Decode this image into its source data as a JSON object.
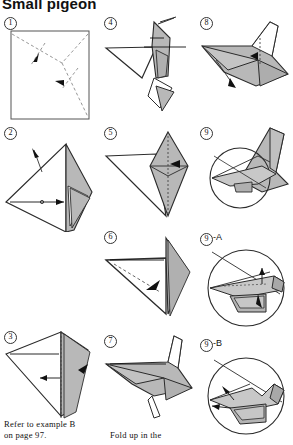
{
  "title": "Small pigeon",
  "colors": {
    "paper_white": "#ffffff",
    "paper_gray": "#b8b8b8",
    "paper_gray_dark": "#9a9a9a",
    "ink": "#1a1a1a",
    "fold_line": "#7a7a7a"
  },
  "steps": [
    {
      "id": "s1",
      "number": "1",
      "suffix": "",
      "label": "1"
    },
    {
      "id": "s2",
      "number": "2",
      "suffix": "",
      "label": "2"
    },
    {
      "id": "s3",
      "number": "3",
      "suffix": "",
      "label": "3"
    },
    {
      "id": "s4",
      "number": "4",
      "suffix": "",
      "label": "4"
    },
    {
      "id": "s5",
      "number": "5",
      "suffix": "",
      "label": "5"
    },
    {
      "id": "s6",
      "number": "6",
      "suffix": "",
      "label": "6"
    },
    {
      "id": "s7",
      "number": "7",
      "suffix": "",
      "label": "7"
    },
    {
      "id": "s8",
      "number": "8",
      "suffix": "",
      "label": "8"
    },
    {
      "id": "s9",
      "number": "9",
      "suffix": "",
      "label": "9"
    },
    {
      "id": "s9a",
      "number": "9",
      "suffix": "-A",
      "label": "9-A"
    },
    {
      "id": "s9b",
      "number": "9",
      "suffix": "-B",
      "label": "9-B"
    }
  ],
  "captions": {
    "left": "Refer to example B\non page 97.",
    "middle": "Fold up in the"
  },
  "icons": {
    "step_badge": "circled-number-icon",
    "fold_arrow": "fold-arrow-icon",
    "valley_fold": "dashed-fold-line-icon",
    "magnifier": "magnifier-circle-icon"
  }
}
